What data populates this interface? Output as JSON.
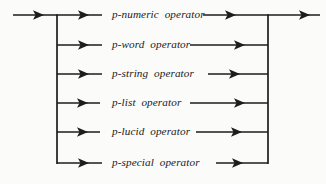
{
  "diagram": {
    "kind": "railroad-syntax-diagram",
    "title": "",
    "line_color": "#1d1d1d",
    "background_color": "#fbfbfa",
    "text_color": "#1a1a1a",
    "entry": {
      "label": "",
      "arrow_icon": "arrow-right-icon"
    },
    "exit": {
      "label": "",
      "arrow_icon": "arrow-right-icon"
    },
    "left_rail_x": 57,
    "right_rail_x": 268,
    "rows": [
      {
        "id": "p-numeric",
        "label": "p-numeric  operator",
        "y": 15,
        "in_arrow_tip_x": 102,
        "in_arrow_line_x": 57,
        "label_x": 112,
        "out_line_start_x": 203,
        "out_arrow_tip_x": 236
      },
      {
        "id": "p-word",
        "label": "p-word  operator",
        "y": 45,
        "in_arrow_tip_x": 102,
        "in_arrow_line_x": 57,
        "label_x": 112,
        "out_line_start_x": 190,
        "out_arrow_tip_x": 245
      },
      {
        "id": "p-string",
        "label": "p-string  operator",
        "y": 74,
        "in_arrow_tip_x": 102,
        "in_arrow_line_x": 57,
        "label_x": 112,
        "out_line_start_x": 208,
        "out_arrow_tip_x": 240
      },
      {
        "id": "p-list",
        "label": "p-list  operator",
        "y": 103,
        "in_arrow_tip_x": 100,
        "in_arrow_line_x": 57,
        "label_x": 112,
        "out_line_start_x": 190,
        "out_arrow_tip_x": 245
      },
      {
        "id": "p-lucid",
        "label": "p-lucid  operator",
        "y": 132,
        "in_arrow_tip_x": 100,
        "in_arrow_line_x": 57,
        "label_x": 112,
        "out_line_start_x": 196,
        "out_arrow_tip_x": 242
      },
      {
        "id": "p-special",
        "label": "p-special  operator",
        "y": 163,
        "in_arrow_tip_x": 102,
        "in_arrow_line_x": 57,
        "label_x": 112,
        "out_line_start_x": 216,
        "out_arrow_tip_x": 243
      }
    ]
  }
}
